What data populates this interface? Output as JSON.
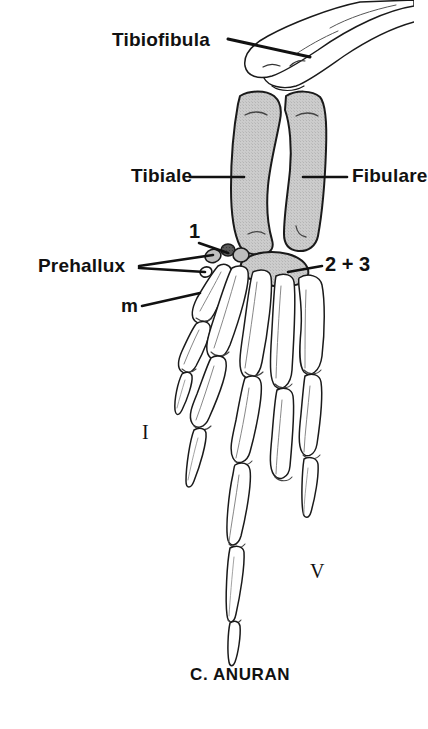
{
  "figure": {
    "caption": "C. ANURAN",
    "background_color": "#ffffff",
    "line_color": "#1a1a1a",
    "shaded_bone_fill": "#c9c9c9",
    "dark_bone_fill": "#4d4d4d",
    "unshaded_bone_fill": "#ffffff"
  },
  "labels": {
    "tibiofibula": "Tibiofibula",
    "tibiale": "Tibiale",
    "fibulare": "Fibulare",
    "prehallux": "Prehallux",
    "element_one": "1",
    "elements_two_three": "2 + 3",
    "metatarsal": "m",
    "digit_first": "I",
    "digit_fifth": "V"
  },
  "bones": [
    {
      "name": "tibiofibula",
      "shading": "unshaded",
      "label": "Tibiofibula"
    },
    {
      "name": "tibiale",
      "shading": "shaded",
      "label": "Tibiale"
    },
    {
      "name": "fibulare",
      "shading": "shaded",
      "label": "Fibulare"
    },
    {
      "name": "tarsal-element-1",
      "shading": "dark",
      "label": "1"
    },
    {
      "name": "tarsal-elements-2-3",
      "shading": "shaded",
      "label": "2 + 3"
    },
    {
      "name": "prehallux-proximal",
      "shading": "shaded",
      "label": "Prehallux"
    },
    {
      "name": "prehallux-distal",
      "shading": "unshaded",
      "label": "Prehallux"
    },
    {
      "name": "metatarsal",
      "shading": "unshaded",
      "label": "m"
    },
    {
      "name": "digit-I",
      "shading": "unshaded",
      "label": "I"
    },
    {
      "name": "digit-V",
      "shading": "unshaded",
      "label": "V"
    }
  ],
  "leader_lines": [
    {
      "from": "Tibiofibula",
      "to": "tibiofibula-bone"
    },
    {
      "from": "Tibiale",
      "to": "tibiale-bone"
    },
    {
      "from": "Fibulare",
      "to": "fibulare-bone"
    },
    {
      "from": "1",
      "to": "tarsal-element-1"
    },
    {
      "from": "2 + 3",
      "to": "tarsal-elements-2-3"
    },
    {
      "from": "Prehallux",
      "to": "prehallux-proximal"
    },
    {
      "from": "Prehallux",
      "to": "prehallux-distal"
    },
    {
      "from": "m",
      "to": "metatarsal"
    }
  ]
}
